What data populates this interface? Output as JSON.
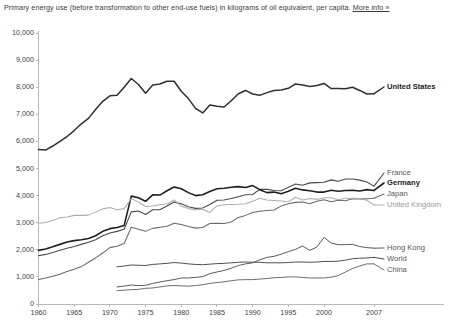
{
  "title": {
    "text": "Primary energy use (before transformation to other end-use fuels) in kilograms of oil equivalent, per capita. ",
    "link_label": "More info »"
  },
  "chart_data": {
    "type": "line",
    "title": "Primary energy use (before transformation to other end-use fuels) in kilograms of oil equivalent, per capita.",
    "xlabel": "",
    "ylabel": "",
    "xlim": [
      1960,
      2007
    ],
    "ylim": [
      0,
      10000
    ],
    "grid": false,
    "legend_position": "right-inline",
    "x_ticks": [
      1960,
      1965,
      1970,
      1975,
      1980,
      1985,
      1990,
      1995,
      2000,
      2007
    ],
    "x_tick_labels": [
      "1960",
      "1965",
      "1970",
      "1975",
      "1980",
      "1985",
      "1990",
      "1995",
      "2000",
      "2007"
    ],
    "y_ticks": [
      0,
      1000,
      2000,
      3000,
      4000,
      5000,
      6000,
      7000,
      8000,
      9000,
      10000
    ],
    "y_tick_labels": [
      "0",
      "1,000",
      "2,000",
      "3,000",
      "4,000",
      "5,000",
      "6,000",
      "7,000",
      "8,000",
      "9,000",
      "10,000"
    ],
    "series": [
      {
        "name": "United States",
        "color": "#2f2f2f",
        "width": 1.5,
        "label_style": "bold",
        "x": [
          1960,
          1961,
          1962,
          1963,
          1964,
          1965,
          1966,
          1967,
          1968,
          1969,
          1970,
          1971,
          1972,
          1973,
          1974,
          1975,
          1976,
          1977,
          1978,
          1979,
          1980,
          1981,
          1982,
          1983,
          1984,
          1985,
          1986,
          1987,
          1988,
          1989,
          1990,
          1991,
          1992,
          1993,
          1994,
          1995,
          1996,
          1997,
          1998,
          1999,
          2000,
          2001,
          2002,
          2003,
          2004,
          2005,
          2006,
          2007
        ],
        "values": [
          5700,
          5680,
          5830,
          6000,
          6180,
          6400,
          6650,
          6850,
          7180,
          7480,
          7680,
          7700,
          8000,
          8320,
          8100,
          7780,
          8080,
          8120,
          8220,
          8220,
          7850,
          7580,
          7220,
          7050,
          7340,
          7300,
          7270,
          7500,
          7760,
          7880,
          7750,
          7700,
          7800,
          7880,
          7900,
          7960,
          8120,
          8080,
          8030,
          8060,
          8140,
          7950,
          7950,
          7940,
          8000,
          7880,
          7750,
          7760
        ]
      },
      {
        "name": "France",
        "color": "#4a4a4a",
        "width": 1.1,
        "label_style": "mid",
        "x": [
          1960,
          1961,
          1962,
          1963,
          1964,
          1965,
          1966,
          1967,
          1968,
          1969,
          1970,
          1971,
          1972,
          1973,
          1974,
          1975,
          1976,
          1977,
          1978,
          1979,
          1980,
          1981,
          1982,
          1983,
          1984,
          1985,
          1986,
          1987,
          1988,
          1989,
          1990,
          1991,
          1992,
          1993,
          1994,
          1995,
          1996,
          1997,
          1998,
          1999,
          2000,
          2001,
          2002,
          2003,
          2004,
          2005,
          2006,
          2007
        ],
        "values": [
          1780,
          1830,
          1900,
          1980,
          2060,
          2120,
          2200,
          2280,
          2370,
          2520,
          2620,
          2680,
          2760,
          3400,
          3430,
          3300,
          3480,
          3480,
          3620,
          3760,
          3700,
          3590,
          3530,
          3540,
          3670,
          3830,
          3840,
          3890,
          3960,
          4030,
          4040,
          4230,
          4230,
          4190,
          4180,
          4310,
          4430,
          4380,
          4470,
          4480,
          4490,
          4580,
          4530,
          4610,
          4610,
          4570,
          4500,
          4350
        ]
      },
      {
        "name": "Germany",
        "color": "#1f1f1f",
        "width": 1.6,
        "label_style": "bold",
        "x": [
          1960,
          1961,
          1962,
          1963,
          1964,
          1965,
          1966,
          1967,
          1968,
          1969,
          1970,
          1971,
          1972,
          1973,
          1974,
          1975,
          1976,
          1977,
          1978,
          1979,
          1980,
          1981,
          1982,
          1983,
          1984,
          1985,
          1986,
          1987,
          1988,
          1989,
          1990,
          1991,
          1992,
          1993,
          1994,
          1995,
          1996,
          1997,
          1998,
          1999,
          2000,
          2001,
          2002,
          2003,
          2004,
          2005,
          2006,
          2007
        ],
        "values": [
          1980,
          2030,
          2110,
          2200,
          2290,
          2340,
          2370,
          2420,
          2520,
          2680,
          2780,
          2820,
          2900,
          3980,
          3920,
          3790,
          4030,
          4020,
          4180,
          4320,
          4250,
          4110,
          4000,
          4030,
          4150,
          4250,
          4270,
          4310,
          4330,
          4300,
          4370,
          4220,
          4110,
          4130,
          4070,
          4160,
          4270,
          4210,
          4180,
          4130,
          4130,
          4200,
          4160,
          4190,
          4200,
          4170,
          4220,
          4190
        ]
      },
      {
        "name": "Japan",
        "color": "#6a6a6a",
        "width": 1.05,
        "label_style": "mid",
        "x": [
          1960,
          1961,
          1962,
          1963,
          1964,
          1965,
          1966,
          1967,
          1968,
          1969,
          1970,
          1971,
          1972,
          1973,
          1974,
          1975,
          1976,
          1977,
          1978,
          1979,
          1980,
          1981,
          1982,
          1983,
          1984,
          1985,
          1986,
          1987,
          1988,
          1989,
          1990,
          1991,
          1992,
          1993,
          1994,
          1995,
          1996,
          1997,
          1998,
          1999,
          2000,
          2001,
          2002,
          2003,
          2004,
          2005,
          2006,
          2007
        ],
        "values": [
          900,
          960,
          1020,
          1100,
          1200,
          1280,
          1380,
          1540,
          1700,
          1880,
          2080,
          2130,
          2230,
          2830,
          2760,
          2680,
          2790,
          2830,
          2870,
          2980,
          2930,
          2860,
          2800,
          2820,
          2970,
          2980,
          2970,
          3030,
          3190,
          3270,
          3380,
          3420,
          3450,
          3470,
          3620,
          3700,
          3750,
          3760,
          3700,
          3790,
          3850,
          3770,
          3830,
          3810,
          3880,
          3880,
          3880,
          3900
        ]
      },
      {
        "name": "United Kingdom",
        "color": "#acacac",
        "width": 1.05,
        "label_style": "light",
        "x": [
          1960,
          1961,
          1962,
          1963,
          1964,
          1965,
          1966,
          1967,
          1968,
          1969,
          1970,
          1971,
          1972,
          1973,
          1974,
          1975,
          1976,
          1977,
          1978,
          1979,
          1980,
          1981,
          1982,
          1983,
          1984,
          1985,
          1986,
          1987,
          1988,
          1989,
          1990,
          1991,
          1992,
          1993,
          1994,
          1995,
          1996,
          1997,
          1998,
          1999,
          2000,
          2001,
          2002,
          2003,
          2004,
          2005,
          2006,
          2007
        ],
        "values": [
          2980,
          3010,
          3080,
          3180,
          3210,
          3270,
          3270,
          3280,
          3390,
          3510,
          3560,
          3480,
          3520,
          3890,
          3760,
          3600,
          3620,
          3660,
          3690,
          3840,
          3610,
          3520,
          3480,
          3500,
          3380,
          3620,
          3660,
          3670,
          3680,
          3700,
          3790,
          3900,
          3840,
          3820,
          3800,
          3770,
          3940,
          3840,
          3890,
          3860,
          3920,
          3920,
          3850,
          3900,
          3900,
          3890,
          3830,
          3650
        ]
      },
      {
        "name": "Hong Kong",
        "color": "#5a5a5a",
        "width": 1.0,
        "label_style": "mid",
        "x": [
          1971,
          1972,
          1973,
          1974,
          1975,
          1976,
          1977,
          1978,
          1979,
          1980,
          1981,
          1982,
          1983,
          1984,
          1985,
          1986,
          1987,
          1988,
          1989,
          1990,
          1991,
          1992,
          1993,
          1994,
          1995,
          1996,
          1997,
          1998,
          1999,
          2000,
          2001,
          2002,
          2003,
          2004,
          2005,
          2006,
          2007
        ],
        "values": [
          630,
          660,
          700,
          680,
          690,
          760,
          810,
          860,
          900,
          960,
          960,
          980,
          1010,
          1120,
          1180,
          1240,
          1320,
          1420,
          1480,
          1520,
          1630,
          1720,
          1760,
          1840,
          1930,
          2020,
          2140,
          1980,
          2100,
          2460,
          2250,
          2190,
          2190,
          2200,
          2120,
          2080,
          2060
        ]
      },
      {
        "name": "World",
        "color": "#4e4e4e",
        "width": 1.0,
        "label_style": "mid",
        "x": [
          1971,
          1972,
          1973,
          1974,
          1975,
          1976,
          1977,
          1978,
          1979,
          1980,
          1981,
          1982,
          1983,
          1984,
          1985,
          1986,
          1987,
          1988,
          1989,
          1990,
          1991,
          1992,
          1993,
          1994,
          1995,
          1996,
          1997,
          1998,
          1999,
          2000,
          2001,
          2002,
          2003,
          2004,
          2005,
          2006,
          2007
        ],
        "values": [
          1370,
          1400,
          1440,
          1430,
          1420,
          1460,
          1480,
          1500,
          1530,
          1510,
          1480,
          1460,
          1450,
          1470,
          1490,
          1500,
          1520,
          1540,
          1550,
          1540,
          1540,
          1520,
          1520,
          1520,
          1530,
          1550,
          1550,
          1540,
          1550,
          1570,
          1570,
          1580,
          1620,
          1670,
          1690,
          1700,
          1720
        ]
      },
      {
        "name": "China",
        "color": "#6d6d6d",
        "width": 1.0,
        "label_style": "mid",
        "x": [
          1971,
          1972,
          1973,
          1974,
          1975,
          1976,
          1977,
          1978,
          1979,
          1980,
          1981,
          1982,
          1983,
          1984,
          1985,
          1986,
          1987,
          1988,
          1989,
          1990,
          1991,
          1992,
          1993,
          1994,
          1995,
          1996,
          1997,
          1998,
          1999,
          2000,
          2001,
          2002,
          2003,
          2004,
          2005,
          2006,
          2007
        ],
        "values": [
          490,
          510,
          530,
          540,
          580,
          590,
          630,
          670,
          680,
          670,
          660,
          680,
          710,
          760,
          790,
          820,
          860,
          890,
          900,
          900,
          920,
          940,
          970,
          980,
          1000,
          1000,
          980,
          960,
          960,
          960,
          990,
          1050,
          1180,
          1310,
          1400,
          1480,
          1480
        ]
      }
    ]
  },
  "y_axis": {
    "labels": [
      "10,000",
      "9,000",
      "8,000",
      "7,000",
      "6,000",
      "5,000",
      "4,000",
      "3,000",
      "2,000",
      "1,000",
      "0"
    ]
  },
  "x_axis": {
    "labels": [
      "1960",
      "1965",
      "1970",
      "1975",
      "1980",
      "1985",
      "1990",
      "1995",
      "2000",
      "2007"
    ]
  },
  "series_labels": [
    {
      "name": "United States"
    },
    {
      "name": "France"
    },
    {
      "name": "Germany"
    },
    {
      "name": "Japan"
    },
    {
      "name": "United Kingdom"
    },
    {
      "name": "Hong Kong"
    },
    {
      "name": "World"
    },
    {
      "name": "China"
    }
  ],
  "colors": {
    "axis": "#b9b9b9",
    "text": "#3d3d3d",
    "bold_series": "#1f1f1f",
    "light_series": "#acacac",
    "background": "#ffffff"
  }
}
